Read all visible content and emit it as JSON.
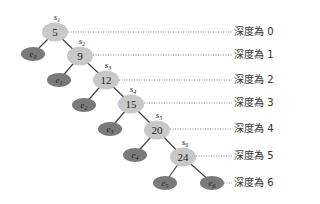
{
  "diagram": {
    "type": "binary-tree",
    "colors": {
      "internal_fill": "#c8c8c8",
      "leaf_fill": "#7a7a7a",
      "edge": "#444444",
      "dotted": "#666666"
    },
    "internal_nodes": [
      {
        "id": "s1",
        "label": "s",
        "sub": "1",
        "value": "5",
        "x": 55,
        "y": 32
      },
      {
        "id": "s2",
        "label": "s",
        "sub": "2",
        "value": "9",
        "x": 80,
        "y": 56
      },
      {
        "id": "s3",
        "label": "s",
        "sub": "3",
        "value": "12",
        "x": 106,
        "y": 80
      },
      {
        "id": "s4",
        "label": "s",
        "sub": "4",
        "value": "15",
        "x": 131,
        "y": 104
      },
      {
        "id": "s5",
        "label": "s",
        "sub": "5",
        "value": "20",
        "x": 157,
        "y": 130
      },
      {
        "id": "s6",
        "label": "s",
        "sub": "6",
        "value": "24",
        "x": 183,
        "y": 157
      }
    ],
    "leaf_nodes": [
      {
        "id": "e0",
        "label": "e",
        "sub": "0",
        "x": 33,
        "y": 54
      },
      {
        "id": "e1",
        "label": "e",
        "sub": "1",
        "x": 59,
        "y": 80
      },
      {
        "id": "e2",
        "label": "e",
        "sub": "2",
        "x": 84,
        "y": 105
      },
      {
        "id": "e3",
        "label": "e",
        "sub": "3",
        "x": 110,
        "y": 129
      },
      {
        "id": "e4",
        "label": "e",
        "sub": "4",
        "x": 135,
        "y": 155
      },
      {
        "id": "e5",
        "label": "e",
        "sub": "5",
        "x": 165,
        "y": 183
      },
      {
        "id": "e6",
        "label": "e",
        "sub": "6",
        "x": 212,
        "y": 183
      }
    ],
    "depth_labels": [
      {
        "text": "深度為 0",
        "y": 32
      },
      {
        "text": "深度為 1",
        "y": 55
      },
      {
        "text": "深度為 2",
        "y": 80
      },
      {
        "text": "深度為 3",
        "y": 103
      },
      {
        "text": "深度為 4",
        "y": 129
      },
      {
        "text": "深度為 5",
        "y": 156
      },
      {
        "text": "深度為 6",
        "y": 183
      }
    ]
  }
}
